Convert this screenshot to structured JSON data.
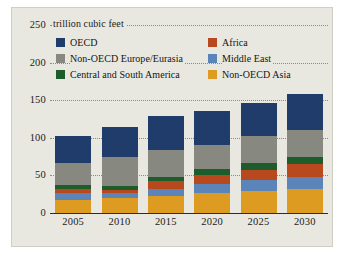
{
  "chart_data": {
    "type": "bar",
    "subtype": "stacked-bar",
    "title": "",
    "units_label": "trillion cubic feet",
    "xlabel": "",
    "ylabel": "",
    "categories": [
      "2005",
      "2010",
      "2015",
      "2020",
      "2025",
      "2030"
    ],
    "ylim": [
      0,
      250
    ],
    "yticks": [
      0,
      50,
      100,
      150,
      200,
      250
    ],
    "ytick_labels": [
      "0",
      "50",
      "100",
      "150",
      "200",
      "250"
    ],
    "grid": true,
    "grid_style": "dotted-horizontal",
    "legend_position": "top-inside-two-columns",
    "series": [
      {
        "name": "Non-OECD Asia",
        "color": "#dd9b22",
        "values": [
          17,
          20,
          23,
          26,
          29,
          32
        ]
      },
      {
        "name": "Middle East",
        "color": "#5b84b8",
        "values": [
          9,
          6,
          9,
          12,
          15,
          16
        ]
      },
      {
        "name": "Africa",
        "color": "#b8491f",
        "values": [
          6,
          5,
          10,
          13,
          13,
          17
        ]
      },
      {
        "name": "Central and South America",
        "color": "#1d5c2b",
        "values": [
          5,
          5,
          6,
          7,
          10,
          9
        ]
      },
      {
        "name": "Non-OECD Europe/Eurasia",
        "color": "#878880",
        "values": [
          29,
          38,
          36,
          33,
          35,
          37
        ]
      },
      {
        "name": "OECD",
        "color": "#1f3c6b",
        "values": [
          37,
          40,
          45,
          45,
          45,
          47
        ]
      }
    ],
    "totals": [
      103,
      114,
      129,
      136,
      147,
      158
    ],
    "stack_order_bottom_to_top": [
      "Non-OECD Asia",
      "Middle East",
      "Africa",
      "Central and South America",
      "Non-OECD Europe/Eurasia",
      "OECD"
    ],
    "colors": {
      "background": "#e9e8e0",
      "axis": "#2c2c28",
      "grid": "#8d8c84",
      "text": "#1b1b1b"
    }
  },
  "legend": {
    "columns": [
      {
        "items": [
          {
            "label": "OECD",
            "color": "#1f3c6b"
          },
          {
            "label": "Non-OECD Europe/Eurasia",
            "color": "#878880"
          },
          {
            "label": "Central and South America",
            "color": "#1d5c2b"
          }
        ]
      },
      {
        "items": [
          {
            "label": "Africa",
            "color": "#b8491f"
          },
          {
            "label": "Middle East",
            "color": "#5b84b8"
          },
          {
            "label": "Non-OECD Asia",
            "color": "#dd9b22"
          }
        ]
      }
    ]
  }
}
